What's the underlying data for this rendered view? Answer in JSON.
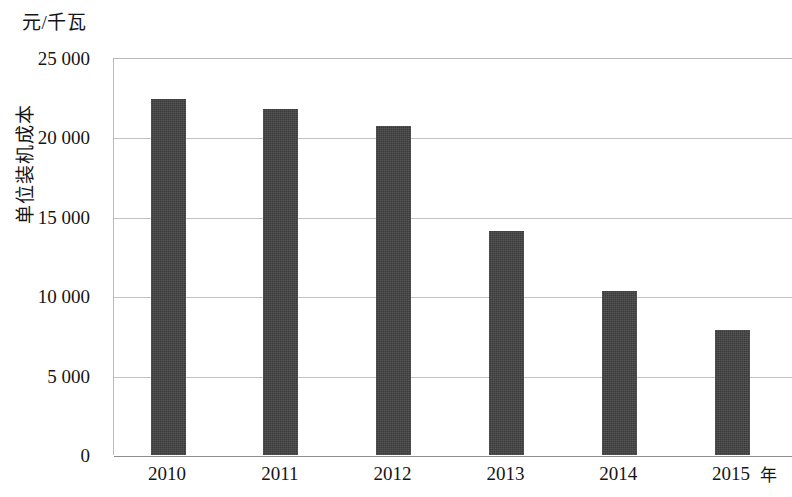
{
  "chart_data": {
    "type": "bar",
    "title": "",
    "subtitle": "",
    "xlabel": "年",
    "ylabel": "单位装机成本",
    "y_unit_label": "元/千瓦",
    "categories": [
      "2010",
      "2011",
      "2012",
      "2013",
      "2014",
      "2015"
    ],
    "values": [
      22400,
      21800,
      20700,
      14100,
      10300,
      7900
    ],
    "series": [
      {
        "name": "单位装机成本",
        "values": [
          22400,
          21800,
          20700,
          14100,
          10300,
          7900
        ]
      }
    ],
    "ylim": [
      0,
      25000
    ],
    "y_ticks": [
      0,
      5000,
      10000,
      15000,
      20000,
      25000
    ],
    "y_tick_labels": [
      "0",
      "5 000",
      "10 000",
      "15 000",
      "20 000",
      "25 000"
    ],
    "grid": true,
    "legend": false,
    "legend_position": "none",
    "bar_color": "#414141",
    "gridline_color": "#c2c2c2",
    "axis_color": "#8e8e8e",
    "background_color": "#ffffff"
  }
}
